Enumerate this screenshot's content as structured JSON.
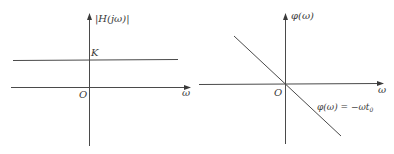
{
  "diagram": {
    "left_plot": {
      "title": "Magnitude response",
      "y_label": "|H(jω)|",
      "x_label": "ω",
      "origin_label": "O",
      "level_label": "K",
      "colors": {
        "stroke": "#4a4a4a",
        "text": "#3a3a3a"
      }
    },
    "right_plot": {
      "title": "Phase response",
      "y_label": "φ(ω)",
      "x_label": "ω",
      "origin_label": "O",
      "curve_label": "φ(ω) = −ωt",
      "curve_label_subscript": "0",
      "colors": {
        "stroke": "#4a4a4a",
        "text": "#3a3a3a"
      }
    }
  }
}
